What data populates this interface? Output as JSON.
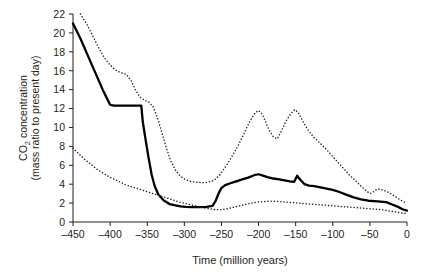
{
  "chart_data": {
    "type": "line",
    "title": "",
    "xlabel": "Time (million years)",
    "ylabel_line1": "CO",
    "ylabel_sub": "2",
    "ylabel_line1_rest": " concentration",
    "ylabel_line2": "(mass ratio to present day)",
    "xlim": [
      -450,
      0
    ],
    "ylim": [
      0,
      22
    ],
    "xticks": [
      -450,
      -400,
      -350,
      -300,
      -250,
      -200,
      -150,
      -100,
      -50,
      0
    ],
    "xtick_labels": [
      "–450",
      "–400",
      "–350",
      "–300",
      "–250",
      "–200",
      "–150",
      "–100",
      "–50",
      "0"
    ],
    "yticks": [
      0,
      2,
      4,
      6,
      8,
      10,
      12,
      14,
      16,
      18,
      20,
      22
    ],
    "ytick_labels": [
      "0",
      "2",
      "4",
      "6",
      "8",
      "10",
      "12",
      "14",
      "16",
      "18",
      "20",
      "22"
    ],
    "grid": false,
    "legend_position": "none",
    "axis_color": "#231f20",
    "series": [
      {
        "name": "best estimate",
        "style": "solid",
        "color": "#000000",
        "width": 2.3,
        "points": [
          [
            -450,
            21.0
          ],
          [
            -440,
            19.4
          ],
          [
            -430,
            17.6
          ],
          [
            -420,
            15.8
          ],
          [
            -410,
            14.0
          ],
          [
            -400,
            12.4
          ],
          [
            -395,
            12.3
          ],
          [
            -380,
            12.3
          ],
          [
            -370,
            12.3
          ],
          [
            -362,
            12.3
          ],
          [
            -358,
            12.3
          ],
          [
            -356,
            10.6
          ],
          [
            -352,
            8.6
          ],
          [
            -348,
            6.7
          ],
          [
            -344,
            5.0
          ],
          [
            -340,
            3.8
          ],
          [
            -335,
            2.9
          ],
          [
            -328,
            2.3
          ],
          [
            -320,
            1.9
          ],
          [
            -312,
            1.75
          ],
          [
            -305,
            1.65
          ],
          [
            -298,
            1.6
          ],
          [
            -290,
            1.58
          ],
          [
            -280,
            1.58
          ],
          [
            -270,
            1.6
          ],
          [
            -262,
            1.7
          ],
          [
            -258,
            2.2
          ],
          [
            -254,
            3.0
          ],
          [
            -250,
            3.6
          ],
          [
            -245,
            3.9
          ],
          [
            -238,
            4.1
          ],
          [
            -230,
            4.3
          ],
          [
            -222,
            4.5
          ],
          [
            -214,
            4.7
          ],
          [
            -206,
            4.95
          ],
          [
            -200,
            5.05
          ],
          [
            -194,
            4.9
          ],
          [
            -188,
            4.75
          ],
          [
            -180,
            4.6
          ],
          [
            -172,
            4.5
          ],
          [
            -165,
            4.4
          ],
          [
            -158,
            4.3
          ],
          [
            -152,
            4.25
          ],
          [
            -148,
            4.9
          ],
          [
            -144,
            4.5
          ],
          [
            -138,
            4.0
          ],
          [
            -132,
            3.85
          ],
          [
            -125,
            3.8
          ],
          [
            -118,
            3.7
          ],
          [
            -110,
            3.55
          ],
          [
            -100,
            3.4
          ],
          [
            -92,
            3.2
          ],
          [
            -82,
            2.9
          ],
          [
            -72,
            2.6
          ],
          [
            -62,
            2.4
          ],
          [
            -52,
            2.25
          ],
          [
            -44,
            2.2
          ],
          [
            -36,
            2.15
          ],
          [
            -28,
            2.1
          ],
          [
            -20,
            1.85
          ],
          [
            -12,
            1.6
          ],
          [
            -6,
            1.35
          ],
          [
            0,
            1.2
          ]
        ]
      },
      {
        "name": "upper bound",
        "style": "dotted",
        "color": "#231f20",
        "width": 1.5,
        "points": [
          [
            -440,
            22.0
          ],
          [
            -432,
            21.0
          ],
          [
            -424,
            19.8
          ],
          [
            -416,
            18.5
          ],
          [
            -408,
            17.4
          ],
          [
            -400,
            16.6
          ],
          [
            -393,
            16.1
          ],
          [
            -386,
            15.8
          ],
          [
            -378,
            15.6
          ],
          [
            -372,
            15.0
          ],
          [
            -366,
            14.0
          ],
          [
            -360,
            13.2
          ],
          [
            -354,
            12.9
          ],
          [
            -348,
            12.7
          ],
          [
            -342,
            12.2
          ],
          [
            -336,
            11.0
          ],
          [
            -330,
            9.4
          ],
          [
            -324,
            7.8
          ],
          [
            -318,
            6.4
          ],
          [
            -312,
            5.5
          ],
          [
            -306,
            4.9
          ],
          [
            -300,
            4.55
          ],
          [
            -292,
            4.3
          ],
          [
            -284,
            4.2
          ],
          [
            -276,
            4.15
          ],
          [
            -268,
            4.2
          ],
          [
            -260,
            4.4
          ],
          [
            -252,
            5.0
          ],
          [
            -244,
            5.9
          ],
          [
            -236,
            6.9
          ],
          [
            -228,
            8.0
          ],
          [
            -220,
            9.3
          ],
          [
            -212,
            10.6
          ],
          [
            -205,
            11.5
          ],
          [
            -200,
            11.8
          ],
          [
            -195,
            11.4
          ],
          [
            -190,
            10.5
          ],
          [
            -185,
            9.6
          ],
          [
            -180,
            9.0
          ],
          [
            -175,
            8.8
          ],
          [
            -172,
            9.2
          ],
          [
            -167,
            10.0
          ],
          [
            -162,
            10.8
          ],
          [
            -156,
            11.5
          ],
          [
            -151,
            11.9
          ],
          [
            -146,
            11.5
          ],
          [
            -140,
            10.6
          ],
          [
            -133,
            9.7
          ],
          [
            -126,
            9.0
          ],
          [
            -118,
            8.4
          ],
          [
            -110,
            7.8
          ],
          [
            -102,
            7.1
          ],
          [
            -94,
            6.4
          ],
          [
            -86,
            5.7
          ],
          [
            -78,
            5.0
          ],
          [
            -70,
            4.4
          ],
          [
            -62,
            3.8
          ],
          [
            -55,
            3.3
          ],
          [
            -50,
            3.0
          ],
          [
            -45,
            3.2
          ],
          [
            -40,
            3.5
          ],
          [
            -35,
            3.45
          ],
          [
            -30,
            3.3
          ],
          [
            -24,
            3.1
          ],
          [
            -18,
            2.8
          ],
          [
            -12,
            2.5
          ],
          [
            -6,
            2.2
          ],
          [
            0,
            2.0
          ]
        ]
      },
      {
        "name": "lower bound",
        "style": "dotted",
        "color": "#231f20",
        "width": 1.5,
        "points": [
          [
            -450,
            7.8
          ],
          [
            -442,
            7.2
          ],
          [
            -434,
            6.6
          ],
          [
            -426,
            6.1
          ],
          [
            -418,
            5.6
          ],
          [
            -410,
            5.2
          ],
          [
            -402,
            4.8
          ],
          [
            -394,
            4.5
          ],
          [
            -386,
            4.2
          ],
          [
            -378,
            3.9
          ],
          [
            -370,
            3.7
          ],
          [
            -362,
            3.5
          ],
          [
            -354,
            3.3
          ],
          [
            -346,
            3.1
          ],
          [
            -338,
            2.9
          ],
          [
            -330,
            2.7
          ],
          [
            -322,
            2.5
          ],
          [
            -314,
            2.3
          ],
          [
            -306,
            2.1
          ],
          [
            -298,
            1.95
          ],
          [
            -290,
            1.8
          ],
          [
            -282,
            1.65
          ],
          [
            -274,
            1.5
          ],
          [
            -266,
            1.4
          ],
          [
            -258,
            1.3
          ],
          [
            -250,
            1.3
          ],
          [
            -242,
            1.4
          ],
          [
            -234,
            1.55
          ],
          [
            -226,
            1.7
          ],
          [
            -218,
            1.85
          ],
          [
            -210,
            2.0
          ],
          [
            -202,
            2.1
          ],
          [
            -194,
            2.15
          ],
          [
            -186,
            2.2
          ],
          [
            -178,
            2.2
          ],
          [
            -170,
            2.15
          ],
          [
            -162,
            2.1
          ],
          [
            -154,
            2.05
          ],
          [
            -146,
            2.0
          ],
          [
            -138,
            1.95
          ],
          [
            -130,
            1.9
          ],
          [
            -122,
            1.85
          ],
          [
            -114,
            1.8
          ],
          [
            -106,
            1.75
          ],
          [
            -98,
            1.7
          ],
          [
            -90,
            1.65
          ],
          [
            -82,
            1.6
          ],
          [
            -74,
            1.55
          ],
          [
            -66,
            1.5
          ],
          [
            -58,
            1.45
          ],
          [
            -50,
            1.4
          ],
          [
            -42,
            1.35
          ],
          [
            -34,
            1.3
          ],
          [
            -26,
            1.2
          ],
          [
            -18,
            1.1
          ],
          [
            -10,
            1.0
          ],
          [
            0,
            0.85
          ]
        ]
      }
    ]
  },
  "axis": {
    "xlabel": "Time (million years)",
    "ylabel_part1": "CO",
    "ylabel_part2": " concentration",
    "ylabel_part3": "(mass ratio to present day)"
  }
}
